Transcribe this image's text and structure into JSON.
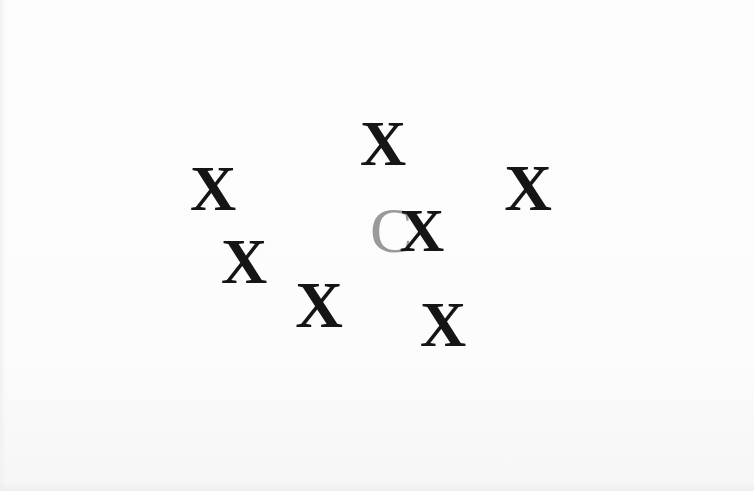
{
  "stimulus": {
    "background_color": "#fcfcfc",
    "distractor_color": "#151515",
    "target_color": "#9a9a9a",
    "items": [
      {
        "id": "target-c",
        "char": "C",
        "role": "target",
        "x": 370,
        "y": 199,
        "w": 38,
        "size": 64
      },
      {
        "id": "x-1",
        "char": "X",
        "role": "distractor",
        "x": 185,
        "y": 157,
        "w": 56,
        "size": 64
      },
      {
        "id": "x-2",
        "char": "X",
        "role": "distractor",
        "x": 355,
        "y": 112,
        "w": 56,
        "size": 64
      },
      {
        "id": "x-3",
        "char": "X",
        "role": "distractor",
        "x": 499,
        "y": 155,
        "w": 58,
        "size": 66
      },
      {
        "id": "x-4",
        "char": "X",
        "role": "distractor",
        "x": 216,
        "y": 230,
        "w": 56,
        "size": 64
      },
      {
        "id": "x-5",
        "char": "X",
        "role": "distractor",
        "x": 289,
        "y": 272,
        "w": 60,
        "size": 66
      },
      {
        "id": "x-6",
        "char": "X",
        "role": "distractor",
        "x": 396,
        "y": 199,
        "w": 52,
        "size": 62
      },
      {
        "id": "x-7",
        "char": "X",
        "role": "distractor",
        "x": 415,
        "y": 293,
        "w": 56,
        "size": 64
      }
    ]
  }
}
